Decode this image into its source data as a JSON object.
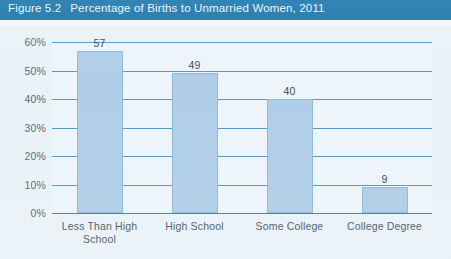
{
  "header": {
    "figure_number": "Figure 5.2",
    "title": "Percentage of Births to Unmarried Women, 2011",
    "background_color": "#1b77ab",
    "text_color": "#eaf4fa"
  },
  "colors": {
    "header": "#1b77ab",
    "page_background": "#e6f0f7",
    "plot_background": "#edf5fa",
    "bar_fill": "#b0cee8",
    "bar_border": "#8fb9dc",
    "gridline": "#4f9cc6",
    "axis_text": "#5b6a72"
  },
  "chart_data": {
    "type": "bar",
    "title": "Percentage of Births to Unmarried Women, 2011",
    "categories": [
      "Less Than High School",
      "High School",
      "Some College",
      "College Degree"
    ],
    "values": [
      57,
      49,
      40,
      9
    ],
    "value_labels": [
      "57",
      "49",
      "40",
      "9"
    ],
    "xlabel": "",
    "ylabel": "",
    "ylim": [
      0,
      60
    ],
    "ytick_values": [
      0,
      10,
      20,
      30,
      40,
      50,
      60
    ],
    "ytick_labels": [
      "0%",
      "10%",
      "20%",
      "30%",
      "40%",
      "50%",
      "60%"
    ],
    "grid": true,
    "grid_axis": "y",
    "legend": false,
    "series": [
      {
        "name": "Percentage of births to unmarried women",
        "values": [
          57,
          49,
          40,
          9
        ]
      }
    ]
  }
}
